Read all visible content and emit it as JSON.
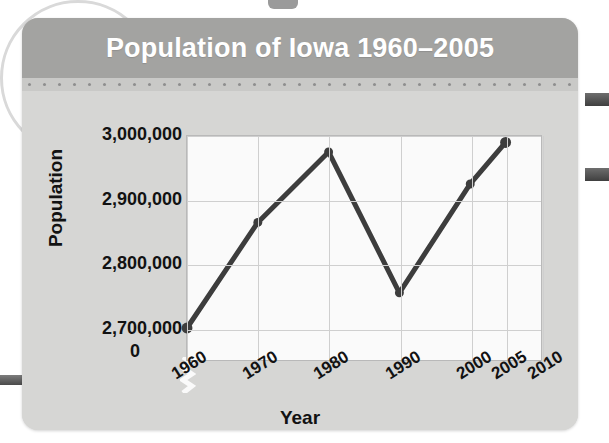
{
  "card": {
    "title": "Population of Iowa 1960–2005"
  },
  "chart_data": {
    "type": "line",
    "title": "Population of Iowa 1960–2005",
    "xlabel": "Year",
    "ylabel": "Population",
    "x": [
      1960,
      1970,
      1980,
      1990,
      2000,
      2005
    ],
    "values": [
      2700000,
      2865000,
      2975000,
      2755000,
      2925000,
      2990000
    ],
    "series": [
      {
        "name": "Population of Iowa",
        "values": [
          2700000,
          2865000,
          2975000,
          2755000,
          2925000,
          2990000
        ]
      }
    ],
    "x_tick_labels": [
      "1960",
      "1970",
      "1980",
      "1990",
      "2000",
      "2005",
      "2010"
    ],
    "x_tick_values": [
      1960,
      1970,
      1980,
      1990,
      2000,
      2005,
      2010
    ],
    "y_tick_labels": [
      "3,000,000",
      "2,900,000",
      "2,800,000",
      "2,700,000"
    ],
    "y_tick_values": [
      3000000,
      2900000,
      2800000,
      2700000
    ],
    "y_origin_label": "0",
    "xlim": [
      1960,
      2010
    ],
    "ylim": [
      2650000,
      3000000
    ],
    "y_axis_break": true,
    "grid": true,
    "legend": "none",
    "line_color": "#3d3d3d",
    "marker": "circle",
    "plot_background": "#fafafa"
  },
  "style": {
    "header_background": "#a3a3a1",
    "card_background": "#d6d6d4",
    "title_color": "#ffffff",
    "text_color": "#121212",
    "grid_color": "#cfcfcf"
  }
}
